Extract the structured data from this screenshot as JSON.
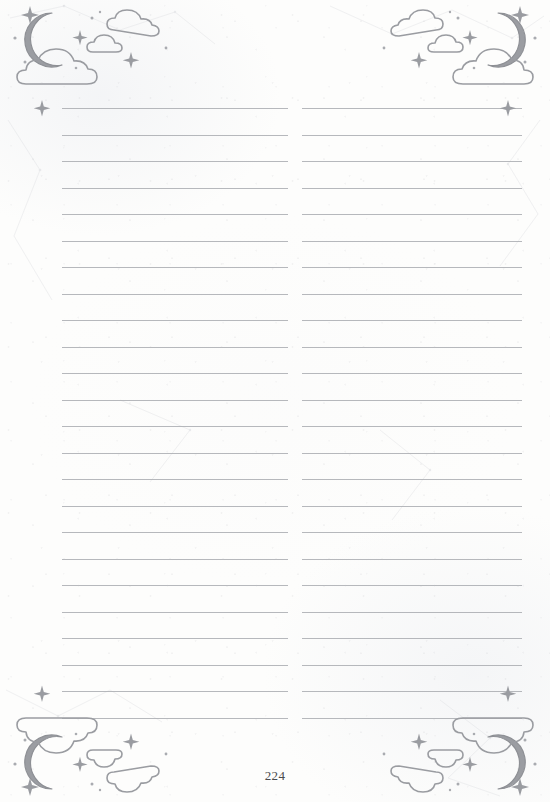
{
  "document": {
    "type": "lined-notebook-page",
    "page_number": "224",
    "paper_color": "#fdfdfc",
    "rule_color": "#a9abb0",
    "art_color": "#9a9ca1",
    "moon_fill": "#9b9da2"
  },
  "layout": {
    "width": 550,
    "height": 802,
    "columns": 2,
    "left_column": {
      "x": 62,
      "width": 226
    },
    "right_column": {
      "x": 302,
      "width": 220
    },
    "first_rule_y": 108,
    "rule_spacing": 26.5,
    "rule_count": 24
  },
  "decorations": {
    "top_left": {
      "name": "crescent-moon-and-clouds",
      "elements": [
        "crescent-moon",
        "cloud-large",
        "cloud-small",
        "sparkle",
        "stars"
      ]
    },
    "top_right": {
      "name": "crescent-moon-and-clouds-mirrored",
      "elements": [
        "crescent-moon",
        "cloud-large",
        "cloud-small",
        "sparkle",
        "stars"
      ]
    },
    "bottom_left": {
      "name": "crescent-moon-and-clouds-flipped",
      "elements": [
        "crescent-moon",
        "cloud-large",
        "cloud-small",
        "sparkle",
        "stars"
      ]
    },
    "bottom_right": {
      "name": "crescent-moon-and-clouds-rotated",
      "elements": [
        "crescent-moon",
        "cloud-large",
        "cloud-small",
        "sparkle",
        "stars"
      ]
    }
  },
  "rules": {
    "ys": [
      108,
      134.5,
      161,
      187.5,
      214,
      240.5,
      267,
      293.5,
      320,
      346.5,
      373,
      399.5,
      426,
      452.5,
      479,
      505.5,
      532,
      558.5,
      585,
      611.5,
      638,
      664.5,
      691,
      717.5
    ]
  }
}
